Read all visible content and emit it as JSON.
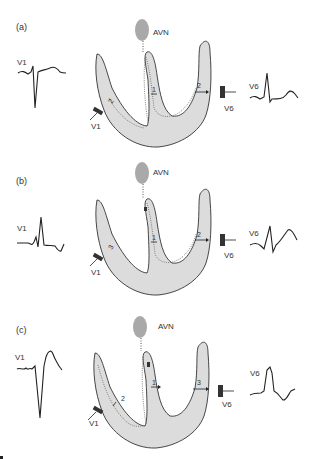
{
  "figure": {
    "panels": [
      {
        "id": "a",
        "letter": "(a)",
        "avn_label": "AVN",
        "lead_left": "V1",
        "lead_left_electrode": "V1",
        "lead_right": "V6",
        "lead_right_electrode": "V6",
        "vectors": [
          "1",
          "2",
          "2"
        ]
      },
      {
        "id": "b",
        "letter": "(b)",
        "avn_label": "AVN",
        "lead_left": "V1",
        "lead_left_electrode": "V1",
        "lead_right": "V6",
        "lead_right_electrode": "V6",
        "vectors": [
          "1",
          "2",
          "3"
        ]
      },
      {
        "id": "c",
        "letter": "(c)",
        "avn_label": "AVN",
        "lead_left": "V1",
        "lead_left_electrode": "V1",
        "lead_right": "V6",
        "lead_right_electrode": "V6",
        "vectors": [
          "1",
          "2",
          "3"
        ]
      }
    ],
    "colors": {
      "ventricle_fill": "#dcdcdc",
      "avn_fill": "#a9a9a9",
      "outline": "#333333",
      "trace": "#222222"
    }
  }
}
